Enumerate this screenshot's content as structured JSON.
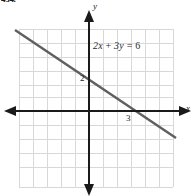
{
  "problem": {
    "number": "434."
  },
  "figure": {
    "equation_label": "2x + 3y = 6",
    "equation_parts": {
      "coef_x": "2",
      "var_x": "x",
      "plus": " + ",
      "coef_y": "3",
      "var_y": "y",
      "equals": " = ",
      "constant": "6"
    },
    "x_axis_label": "x",
    "y_axis_label": "y",
    "y_intercept_label": "2",
    "x_intercept_label": "3",
    "colors": {
      "grid": "#d8d8d8",
      "axis": "#1a1a1a",
      "line": "#5a5a5a",
      "text": "#1c1c1c",
      "background": "#ffffff"
    }
  },
  "chart_data": {
    "type": "line",
    "title": "2x + 3y = 6",
    "xlabel": "x",
    "ylabel": "y",
    "grid": true,
    "legend": "none",
    "equation": "2x + 3y = 6",
    "slope": -0.6666666667,
    "y_intercept": 2,
    "x_intercept": 3,
    "xlim": [
      -5.6,
      7.6
    ],
    "ylim": [
      -5.4,
      6.0
    ],
    "grid_step": 1,
    "series": [
      {
        "name": "2x + 3y = 6",
        "points": [
          {
            "x": -5.3,
            "y": 5.53
          },
          {
            "x": 0,
            "y": 2
          },
          {
            "x": 3,
            "y": 0
          },
          {
            "x": 6.1,
            "y": -2.07
          }
        ]
      }
    ],
    "annotations": [
      {
        "text": "2",
        "x": 0,
        "y": 2,
        "note": "y-intercept label"
      },
      {
        "text": "3",
        "x": 3,
        "y": 0,
        "note": "x-intercept label"
      },
      {
        "text": "2x + 3y = 6",
        "x": 1.4,
        "y": 4.4,
        "note": "equation label"
      }
    ]
  }
}
